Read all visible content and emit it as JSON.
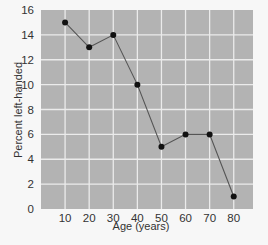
{
  "chart_data": {
    "type": "line",
    "title": "",
    "xlabel": "Age (years)",
    "ylabel": "Percent left-handed",
    "x": [
      10,
      20,
      30,
      40,
      50,
      60,
      70,
      80
    ],
    "series": [
      {
        "name": "Percent left-handed",
        "values": [
          15,
          13,
          14,
          10,
          5,
          6,
          6,
          1
        ]
      }
    ],
    "x_ticks": [
      10,
      20,
      30,
      40,
      50,
      60,
      70,
      80
    ],
    "y_ticks": [
      0,
      2,
      4,
      6,
      8,
      10,
      12,
      14,
      16
    ],
    "xlim": [
      0,
      88
    ],
    "ylim": [
      0,
      16
    ],
    "grid": true,
    "legend": "none",
    "colors": {
      "plot_background": "#b3b3b3",
      "grid": "#ebebeb",
      "line": "#555555",
      "marker": "#111111",
      "page_background": "#f7f7f7"
    }
  }
}
